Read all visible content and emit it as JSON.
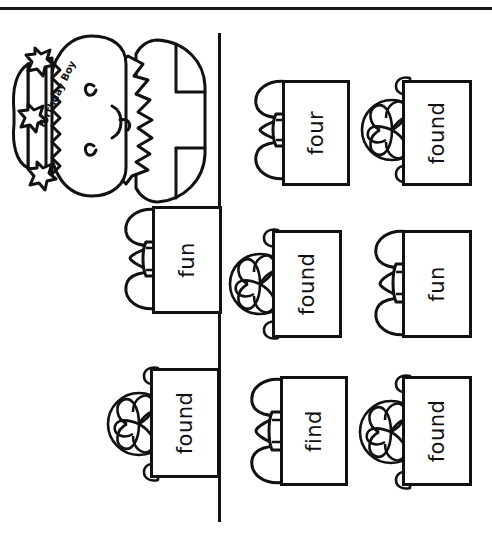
{
  "worksheet": {
    "type": "sight-word-gift-worksheet",
    "orientation": "rotated-90",
    "page_rule_label": "top-page-border",
    "fold_line_label": "vertical-fold-line",
    "ink_color": "#111111",
    "paper_color": "#ffffff"
  },
  "character": {
    "name": "birthday-boy",
    "crown_text": "Birthday Boy",
    "eyes": "closed-happy-eyes",
    "hat": "party-crown-with-stars",
    "star_count": 3
  },
  "gifts": [
    {
      "id": "gift-1",
      "word": "four",
      "bow": "ribbon-bow",
      "row": 1,
      "col": 2
    },
    {
      "id": "gift-2",
      "word": "found",
      "bow": "pom-pom-bow",
      "row": 1,
      "col": 3
    },
    {
      "id": "gift-3",
      "word": "fun",
      "bow": "ribbon-bow",
      "row": 2,
      "col": 1
    },
    {
      "id": "gift-4",
      "word": "found",
      "bow": "pom-pom-bow",
      "row": 2,
      "col": 2
    },
    {
      "id": "gift-5",
      "word": "fun",
      "bow": "ribbon-bow",
      "row": 2,
      "col": 3
    },
    {
      "id": "gift-6",
      "word": "found",
      "bow": "pom-pom-bow",
      "row": 3,
      "col": 1
    },
    {
      "id": "gift-7",
      "word": "find",
      "bow": "ribbon-bow",
      "row": 3,
      "col": 2
    },
    {
      "id": "gift-8",
      "word": "found",
      "bow": "pom-pom-bow",
      "row": 3,
      "col": 3
    }
  ]
}
